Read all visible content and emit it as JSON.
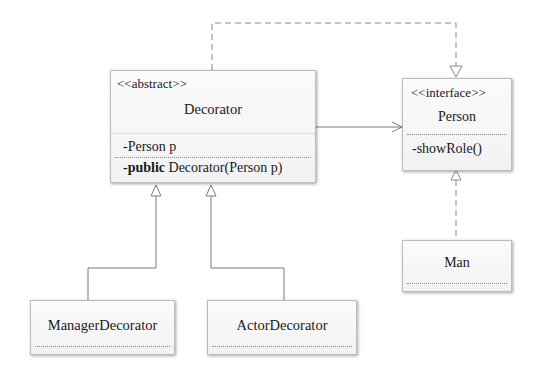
{
  "classes": {
    "decorator": {
      "stereotype": "<<abstract>>",
      "name": "Decorator",
      "attribute": "-Person p",
      "method_keyword": "-public",
      "method_rest": " Decorator(Person p)"
    },
    "person": {
      "stereotype": "<<interface>>",
      "name": "Person",
      "method": "-showRole()"
    },
    "man": {
      "name": "Man"
    },
    "manager_decorator": {
      "name": "ManagerDecorator"
    },
    "actor_decorator": {
      "name": "ActorDecorator"
    }
  },
  "relationships": [
    {
      "from": "Decorator",
      "to": "Person",
      "type": "realization"
    },
    {
      "from": "Decorator",
      "to": "Person",
      "type": "association"
    },
    {
      "from": "Man",
      "to": "Person",
      "type": "realization"
    },
    {
      "from": "ManagerDecorator",
      "to": "Decorator",
      "type": "generalization"
    },
    {
      "from": "ActorDecorator",
      "to": "Decorator",
      "type": "generalization"
    }
  ],
  "colors": {
    "line": "#7a7a7a",
    "box_border": "#bcbcbc",
    "box_fill": "#f6f6f6"
  }
}
